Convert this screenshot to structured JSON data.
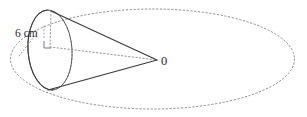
{
  "figure": {
    "type": "geometry-diagram",
    "canvas": {
      "width": 307,
      "height": 117,
      "background": "#ffffff"
    }
  },
  "colors": {
    "stroke_solid": "#3a3a3a",
    "stroke_dotted": "#8a8a8a",
    "stroke_guide": "#9a9a9a",
    "text": "#2b2b2b"
  },
  "labels": {
    "radius_label": "6 cm",
    "apex_label": "0"
  },
  "shapes": {
    "outer_ellipse": {
      "name": "large-dotted-ellipse",
      "style": "dotted",
      "cx": 152.5,
      "cy": 59,
      "rx": 142,
      "ry": 50
    },
    "cone_base_ellipse": {
      "name": "cone-base-ellipse",
      "style": "solid",
      "cx": 50,
      "cy": 50,
      "rx": 22,
      "ry": 40,
      "rotation": -4
    },
    "apex_point": {
      "x": 157,
      "y": 60
    },
    "cone_top_vertex": {
      "x": 51,
      "y": 11
    },
    "cone_bottom_vertex": {
      "x": 48,
      "y": 90
    },
    "axis_line": {
      "name": "cone-axis",
      "style": "dotted",
      "from": {
        "x": 50,
        "y": 47
      },
      "to": {
        "x": 157,
        "y": 60
      }
    },
    "height_line": {
      "name": "cone-height-line",
      "style": "dotted",
      "from": {
        "x": 51,
        "y": 11
      },
      "to": {
        "x": 50,
        "y": 47
      }
    },
    "right_angle_marker": {
      "name": "right-angle-marker",
      "x": 44,
      "y": 41,
      "size": 7
    },
    "leader_line": {
      "name": "radius-leader-line",
      "style": "dotted",
      "from": {
        "x": 36,
        "y": 33
      },
      "to": {
        "x": 18,
        "y": 55
      }
    }
  },
  "label_positions": {
    "radius_label": {
      "x": 17,
      "y": 38
    },
    "apex_label": {
      "x": 161,
      "y": 64
    }
  }
}
